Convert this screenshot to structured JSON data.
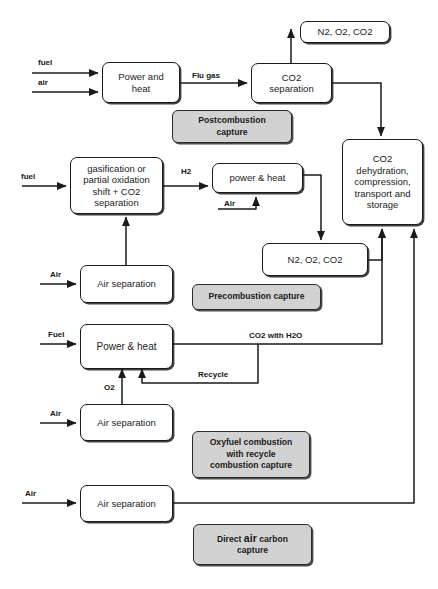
{
  "diagram": {
    "colors": {
      "stroke": "#1a1a1a",
      "node_fill": "#ffffff",
      "legend_fill": "#d2d2d2",
      "text": "#1c1c1c",
      "background": "#ffffff"
    },
    "nodes": [
      {
        "id": "power_and_heat",
        "label": "Power and\nheat"
      },
      {
        "id": "co2_separation",
        "label": "CO2\nseparation"
      },
      {
        "id": "vent_top",
        "label": "N2, O2, CO2"
      },
      {
        "id": "gasification",
        "label": "gasification or\npartial oxidation\nshift + CO2\nseparation"
      },
      {
        "id": "power_heat_pre",
        "label": "power & heat"
      },
      {
        "id": "co2_dehydration",
        "label": "CO2\ndehydration,\ncompression,\ntransport and\nstorage"
      },
      {
        "id": "vent_mid",
        "label": "N2, O2, CO2"
      },
      {
        "id": "air_separation_pre",
        "label": "Air separation"
      },
      {
        "id": "power_heat_oxy",
        "label": "Power & heat"
      },
      {
        "id": "air_separation_oxy",
        "label": "Air separation"
      },
      {
        "id": "air_separation_dac",
        "label": "Air separation"
      }
    ],
    "legends": [
      {
        "id": "postcombustion",
        "label": "Postcombustion\ncapture"
      },
      {
        "id": "precombustion",
        "label": "Precombustion capture"
      },
      {
        "id": "oxyfuel",
        "label": "Oxyfuel combustion\nwith recycle\ncombustion capture"
      },
      {
        "id": "direct_air",
        "label_parts": [
          "Direct ",
          "air",
          " carbon"
        ],
        "label_line2": "capture"
      }
    ],
    "edge_labels": {
      "fuel_top": "fuel",
      "air_top": "air",
      "flu_gas": "Flu gas",
      "fuel_pre": "fuel",
      "h2": "H2",
      "air_pre": "Air",
      "air_sep_pre": "Air",
      "fuel_oxy": "Fuel",
      "co2_with_h2o": "CO2 with H2O",
      "recycle": "Recycle",
      "o2": "O2",
      "air_oxy": "Air",
      "air_dac": "Air"
    }
  }
}
